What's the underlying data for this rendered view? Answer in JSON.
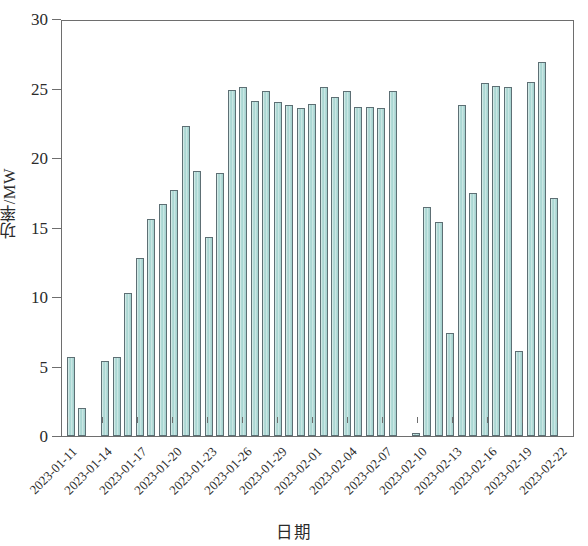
{
  "chart_data": {
    "type": "bar",
    "title": "",
    "xlabel": "日期",
    "ylabel": "功率/MW",
    "ylim": [
      0,
      30
    ],
    "yticks": [
      0,
      5,
      10,
      15,
      20,
      25,
      30
    ],
    "ytick_labels": [
      "0",
      "5",
      "10",
      "15",
      "20",
      "25",
      "30"
    ],
    "grid": false,
    "legend": null,
    "xtick_labels": [
      "2023-01-11",
      "2023-01-14",
      "2023-01-17",
      "2023-01-20",
      "2023-01-23",
      "2023-01-26",
      "2023-01-29",
      "2023-02-01",
      "2023-02-04",
      "2023-02-07",
      "2023-02-10",
      "2023-02-13",
      "2023-02-16",
      "2023-02-19",
      "2023-02-22"
    ],
    "xtick_indices": [
      0,
      3,
      6,
      9,
      12,
      15,
      18,
      21,
      24,
      27,
      30,
      33,
      36,
      39,
      42
    ],
    "bar_color": "#aed7d3",
    "bar_edge_color": "#5d6f74",
    "categories": [
      "2023-01-11",
      "2023-01-12",
      "2023-01-13",
      "2023-01-14",
      "2023-01-15",
      "2023-01-16",
      "2023-01-17",
      "2023-01-18",
      "2023-01-19",
      "2023-01-20",
      "2023-01-21",
      "2023-01-22",
      "2023-01-23",
      "2023-01-24",
      "2023-01-25",
      "2023-01-26",
      "2023-01-27",
      "2023-01-28",
      "2023-01-29",
      "2023-01-30",
      "2023-01-31",
      "2023-02-01",
      "2023-02-02",
      "2023-02-03",
      "2023-02-04",
      "2023-02-05",
      "2023-02-06",
      "2023-02-07",
      "2023-02-08",
      "2023-02-09",
      "2023-02-10",
      "2023-02-11",
      "2023-02-12",
      "2023-02-13",
      "2023-02-14",
      "2023-02-15",
      "2023-02-16",
      "2023-02-17",
      "2023-02-18",
      "2023-02-19",
      "2023-02-20",
      "2023-02-21",
      "2023-02-22",
      "2023-02-23"
    ],
    "values": [
      5.7,
      2.0,
      0.0,
      5.4,
      5.7,
      10.3,
      12.8,
      15.6,
      16.7,
      17.7,
      22.3,
      19.1,
      14.3,
      18.9,
      24.9,
      25.1,
      24.1,
      24.8,
      24.0,
      23.8,
      23.6,
      23.9,
      25.1,
      24.4,
      24.8,
      23.7,
      23.7,
      23.6,
      24.8,
      0.0,
      0.2,
      16.5,
      15.4,
      7.4,
      23.8,
      17.5,
      25.4,
      25.2,
      25.1,
      6.1,
      25.5,
      26.9,
      17.1,
      0.0
    ],
    "units": "MW",
    "series_name": "功率"
  },
  "figure": {
    "axis_color": "#6e6e6e",
    "background": "#ffffff"
  }
}
